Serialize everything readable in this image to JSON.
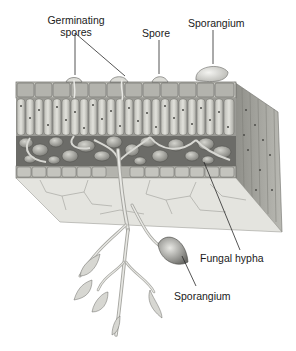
{
  "figure": {
    "labels": {
      "germinating_spores_line1": "Germinating",
      "germinating_spores_line2": "spores",
      "spore": "Spore",
      "sporangium_top": "Sporangium",
      "fungal_hypha": "Fungal hypha",
      "sporangium_bottom": "Sporangium"
    },
    "colors": {
      "background": "#ffffff",
      "tissue_light": "#d9d9d4",
      "tissue_mid": "#a9a9a4",
      "tissue_dark": "#5e5e5a",
      "leader_line": "#2a2a2a",
      "text": "#1a1a1a"
    }
  }
}
